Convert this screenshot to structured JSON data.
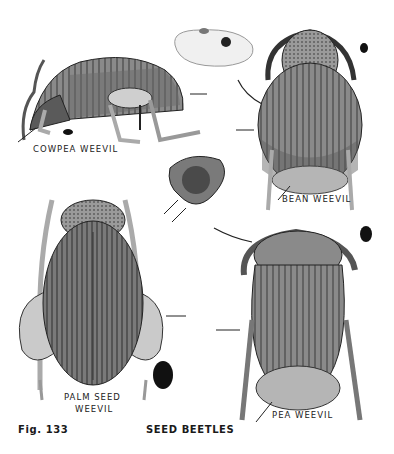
{
  "figure": {
    "number_label": "Fig. 133",
    "title": "SEED BEETLES"
  },
  "specimens": [
    {
      "name": "COWPEA WEEVIL",
      "view": "side"
    },
    {
      "name": "BEAN WEEVIL",
      "view": "dorsal"
    },
    {
      "name": "PALM SEED WEEVIL",
      "line1": "PALM SEED",
      "line2": "WEEVIL",
      "view": "dorsal"
    },
    {
      "name": "PEA WEEVIL",
      "view": "dorsal"
    }
  ],
  "extras": {
    "seed": "bean seed with exit hole",
    "head_detail": "frontal head close-up"
  },
  "colors": {
    "background": "#ffffff",
    "ink": "#222222",
    "body_dark": "#4a4a4a",
    "body_mid": "#8a8a8a",
    "body_light": "#c8c8c8"
  }
}
